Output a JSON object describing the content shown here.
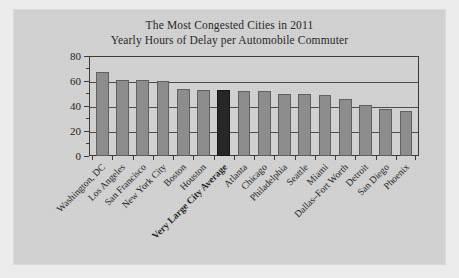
{
  "figure": {
    "title_line1": "The Most Congested Cities in 2011",
    "title_line2": "Yearly Hours of Delay per Automobile Commuter",
    "background_color": "#d2d2d2",
    "page_color": "#ebebec",
    "bar_color": "#8d8d8d",
    "highlight_bar_color": "#242424",
    "axis_color": "#3a3a3a"
  },
  "chart_data": {
    "type": "bar",
    "title": "The Most Congested Cities in 2011\nYearly Hours of Delay per Automobile Commuter",
    "xlabel": "",
    "ylabel": "",
    "ylim": [
      0,
      80
    ],
    "yticks": [
      0,
      20,
      40,
      60,
      80
    ],
    "ytick_labels": [
      "0",
      "20",
      "40",
      "60",
      "80"
    ],
    "minor_yticks": [
      10,
      30,
      50,
      70
    ],
    "grid": true,
    "grid_axis": "y",
    "legend": false,
    "highlight_category": "Very Large City Average",
    "categories": [
      "Washington, DC",
      "Los Angeles",
      "San Francisco",
      "New York City",
      "Boston",
      "Houston",
      "Very Large City Average",
      "Atlanta",
      "Chicago",
      "Philadelphia",
      "Seattle",
      "Miami",
      "Dallas–Fort Worth",
      "Detroit",
      "San Diego",
      "Phoenix"
    ],
    "values": [
      67,
      61,
      61,
      60,
      54,
      53,
      53,
      52,
      52,
      50,
      50,
      49,
      46,
      41,
      38,
      36
    ],
    "units": "hours per year"
  }
}
